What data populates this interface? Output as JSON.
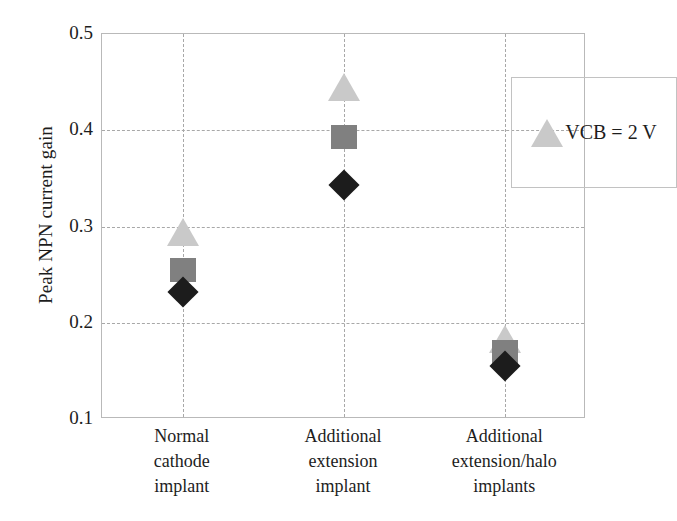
{
  "chart_data": {
    "type": "scatter",
    "title": "",
    "xlabel": "",
    "ylabel": "Peak NPN current gain",
    "ylim": [
      0.1,
      0.5
    ],
    "yticks": [
      0.5,
      0.4,
      0.3,
      0.2,
      0.1
    ],
    "ytick_labels": [
      "0.5",
      "0.4",
      "0.3",
      "0.2",
      "0.1"
    ],
    "grid": true,
    "legend_position": "top-right",
    "categories": [
      "Normal\ncathode\nimplant",
      "Additional\nextension\nimplant",
      "Additional\nextension/halo\nimplants"
    ],
    "category_lines": [
      [
        "Normal",
        "cathode",
        "implant"
      ],
      [
        "Additional",
        "extension",
        "implant"
      ],
      [
        "Additional",
        "extension/halo",
        "implants"
      ]
    ],
    "series": [
      {
        "name": "VCB = 2 V",
        "marker": "triangle",
        "color": "#c9c9c9",
        "values": [
          0.3,
          0.45,
          0.188
        ]
      },
      {
        "name": "series-square",
        "marker": "square",
        "color": "#808080",
        "values": [
          0.255,
          0.393,
          0.17
        ]
      },
      {
        "name": "series-diamond",
        "marker": "diamond",
        "color": "#1c1c1c",
        "values": [
          0.232,
          0.343,
          0.155
        ]
      }
    ],
    "legend": [
      {
        "label": "VCB = 2 V",
        "marker": "triangle",
        "color": "#c9c9c9"
      }
    ],
    "colors": {
      "grid": "#a8a8a8",
      "axis": "#b9b9b9",
      "text": "#1d1d1d",
      "light_gray_marker": "#c9c9c9",
      "mid_gray_marker": "#808080",
      "dark_marker": "#1c1c1c"
    }
  }
}
